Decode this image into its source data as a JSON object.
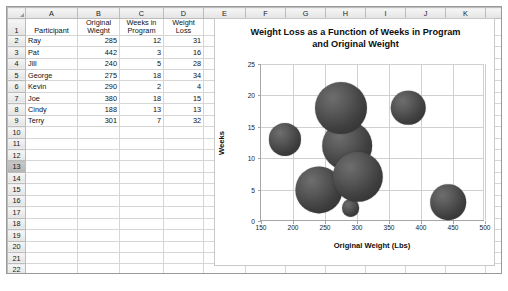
{
  "sheet": {
    "column_headers": [
      "A",
      "B",
      "C",
      "D",
      "E",
      "F",
      "G",
      "H",
      "I",
      "J",
      "K",
      "L"
    ],
    "row_numbers": [
      "1",
      "2",
      "3",
      "4",
      "5",
      "6",
      "7",
      "8",
      "9",
      "10",
      "11",
      "12",
      "13",
      "14",
      "15",
      "16",
      "17",
      "18",
      "19",
      "20",
      "21",
      "22",
      "23"
    ],
    "selected_row": "13",
    "headers": {
      "a": "Participant",
      "b_line1": "Original",
      "b_line2": "Wieght",
      "c_line1": "Weeks in",
      "c_line2": "Program",
      "d_line1": "Weight",
      "d_line2": "Loss"
    },
    "rows": [
      {
        "row": "2",
        "participant": "Ray",
        "original_weight": "285",
        "weeks_in_program": "12",
        "weight_loss": "31"
      },
      {
        "row": "3",
        "participant": "Pat",
        "original_weight": "442",
        "weeks_in_program": "3",
        "weight_loss": "16"
      },
      {
        "row": "4",
        "participant": "Jill",
        "original_weight": "240",
        "weeks_in_program": "5",
        "weight_loss": "28"
      },
      {
        "row": "5",
        "participant": "George",
        "original_weight": "275",
        "weeks_in_program": "18",
        "weight_loss": "34"
      },
      {
        "row": "6",
        "participant": "Kevin",
        "original_weight": "290",
        "weeks_in_program": "2",
        "weight_loss": "4"
      },
      {
        "row": "7",
        "participant": "Joe",
        "original_weight": "380",
        "weeks_in_program": "18",
        "weight_loss": "15"
      },
      {
        "row": "8",
        "participant": "Cindy",
        "original_weight": "188",
        "weeks_in_program": "13",
        "weight_loss": "13"
      },
      {
        "row": "9",
        "participant": "Terry",
        "original_weight": "301",
        "weeks_in_program": "7",
        "weight_loss": "32"
      }
    ]
  },
  "chart_data": {
    "type": "scatter",
    "title": "Weight Loss as a Function of Weeks in Program and Original Weight",
    "title_line1": "Weight Loss as a Function of Weeks in Program",
    "title_line2": "and Original Weight",
    "xlabel": "Original Weight (Lbs)",
    "ylabel": "Weeks",
    "xlim": [
      150,
      500
    ],
    "ylim": [
      0,
      25
    ],
    "xticks": [
      "150",
      "200",
      "250",
      "300",
      "350",
      "400",
      "450",
      "500"
    ],
    "yticks": [
      "0",
      "5",
      "10",
      "15",
      "20",
      "25"
    ],
    "grid": true,
    "legend": "none",
    "bubble_color": "#4a4a4a",
    "points": [
      {
        "name": "Ray",
        "x": 285,
        "y": 12,
        "size": 31
      },
      {
        "name": "Pat",
        "x": 442,
        "y": 3,
        "size": 16
      },
      {
        "name": "Jill",
        "x": 240,
        "y": 5,
        "size": 28
      },
      {
        "name": "George",
        "x": 275,
        "y": 18,
        "size": 34
      },
      {
        "name": "Kevin",
        "x": 290,
        "y": 2,
        "size": 4
      },
      {
        "name": "Joe",
        "x": 380,
        "y": 18,
        "size": 15
      },
      {
        "name": "Cindy",
        "x": 188,
        "y": 13,
        "size": 13
      },
      {
        "name": "Terry",
        "x": 301,
        "y": 7,
        "size": 32
      }
    ]
  }
}
